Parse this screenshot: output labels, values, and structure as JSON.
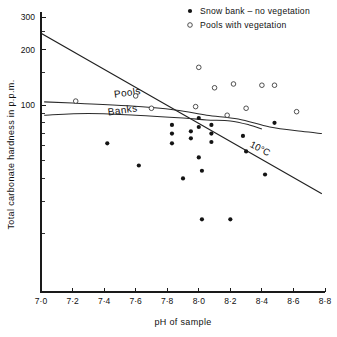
{
  "chart_data": {
    "type": "scatter",
    "title": "",
    "xlabel": "pH of sample",
    "ylabel": "Total carbonate hardness in p.p.m.",
    "xlim": [
      7.0,
      8.8
    ],
    "ylim": [
      10,
      300
    ],
    "yscale": "log",
    "xscale": "linear",
    "grid": false,
    "xticks": [
      7.0,
      7.2,
      7.4,
      7.6,
      7.8,
      8.0,
      8.2,
      8.4,
      8.6,
      8.8
    ],
    "xticklabels": [
      "7·0",
      "7·2",
      "7·4",
      "7·6",
      "7·8",
      "8·0",
      "8·2",
      "8·4",
      "8·6",
      "8·8"
    ],
    "yticks": [
      100,
      200,
      300
    ],
    "yticklabels": [
      "100",
      "200",
      "300"
    ],
    "yminorticks": [
      20,
      30,
      40,
      50,
      60,
      70,
      80,
      90,
      150,
      250
    ],
    "legend_position": "top-right",
    "series": [
      {
        "name": "Snow bank – no vegetation",
        "marker": "filled-circle",
        "color": "#141414",
        "points": [
          [
            7.42,
            62
          ],
          [
            7.62,
            47
          ],
          [
            7.83,
            78
          ],
          [
            7.83,
            70
          ],
          [
            7.83,
            62
          ],
          [
            7.9,
            40
          ],
          [
            7.95,
            72
          ],
          [
            7.95,
            66
          ],
          [
            8.0,
            85
          ],
          [
            8.0,
            76
          ],
          [
            8.0,
            52
          ],
          [
            8.02,
            44
          ],
          [
            8.02,
            24
          ],
          [
            8.08,
            78
          ],
          [
            8.08,
            70
          ],
          [
            8.08,
            63
          ],
          [
            8.2,
            24
          ],
          [
            8.28,
            68
          ],
          [
            8.3,
            56
          ],
          [
            8.42,
            42
          ],
          [
            8.48,
            80
          ]
        ]
      },
      {
        "name": "Pools with vegetation",
        "marker": "open-circle",
        "color": "#333333",
        "points": [
          [
            7.22,
            105
          ],
          [
            7.6,
            112
          ],
          [
            7.7,
            96
          ],
          [
            7.98,
            98
          ],
          [
            8.0,
            160
          ],
          [
            8.1,
            124
          ],
          [
            8.18,
            88
          ],
          [
            8.22,
            130
          ],
          [
            8.3,
            96
          ],
          [
            8.4,
            128
          ],
          [
            8.48,
            128
          ],
          [
            8.62,
            92
          ]
        ]
      }
    ],
    "lines": [
      {
        "name": "10°C saturation line",
        "label": "10°C",
        "style": "straight",
        "points": [
          [
            7.0,
            245
          ],
          [
            8.78,
            33
          ]
        ]
      },
      {
        "name": "Pools curve",
        "label": "Pools",
        "style": "curve",
        "points": [
          [
            7.02,
            104
          ],
          [
            7.25,
            102
          ],
          [
            7.55,
            99
          ],
          [
            7.85,
            94
          ],
          [
            8.05,
            88
          ],
          [
            8.25,
            84
          ],
          [
            8.45,
            76
          ],
          [
            8.65,
            72
          ],
          [
            8.78,
            70
          ]
        ]
      },
      {
        "name": "Banks curve",
        "label": "Banks",
        "style": "curve",
        "points": [
          [
            7.02,
            88
          ],
          [
            7.3,
            90
          ],
          [
            7.6,
            88
          ],
          [
            7.9,
            85
          ],
          [
            8.05,
            83
          ],
          [
            8.2,
            82
          ],
          [
            8.32,
            78
          ],
          [
            8.4,
            74
          ]
        ]
      }
    ],
    "annotations": [
      {
        "text": "Pools",
        "x": 7.55,
        "y": 112
      },
      {
        "text": "Banks",
        "x": 7.52,
        "y": 90
      },
      {
        "text": "10°C",
        "x": 8.38,
        "y": 56
      }
    ]
  },
  "legend": {
    "items": [
      {
        "label": "Snow bank – no vegetation",
        "marker": "filled-circle"
      },
      {
        "label": "Pools with vegetation",
        "marker": "open-circle"
      }
    ]
  },
  "axes": {
    "x_title": "pH of sample",
    "y_title": "Total carbonate hardness in p.p.m."
  }
}
